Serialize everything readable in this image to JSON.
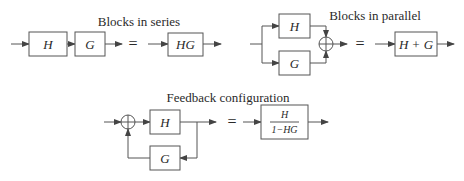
{
  "series": {
    "title": "Blocks in series",
    "blocks": [
      "H",
      "G"
    ],
    "equals": "=",
    "result": "HG"
  },
  "parallel": {
    "title": "Blocks in parallel",
    "blocks": [
      "H",
      "G"
    ],
    "equals": "=",
    "result": "H + G"
  },
  "feedback": {
    "title": "Feedback configuration",
    "forward": "H",
    "feedback": "G",
    "equals": "=",
    "result_numerator": "H",
    "result_denominator": "1−HG"
  },
  "colors": {
    "line": "#555555",
    "text": "#2a2a2a",
    "background": "#ffffff"
  }
}
